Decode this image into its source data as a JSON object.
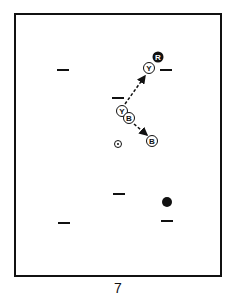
{
  "figure": {
    "caption": "7",
    "court": {
      "x": 15,
      "y": 14,
      "width": 206,
      "height": 262
    },
    "markers": [
      {
        "type": "dash",
        "x": 57,
        "y": 70
      },
      {
        "type": "dash",
        "x": 160,
        "y": 70
      },
      {
        "type": "dash",
        "x": 112,
        "y": 98
      },
      {
        "type": "dash",
        "x": 113,
        "y": 194
      },
      {
        "type": "dash",
        "x": 161,
        "y": 221
      },
      {
        "type": "dash",
        "x": 58,
        "y": 223
      }
    ],
    "players": [
      {
        "label": "R",
        "style": "filled",
        "x": 158,
        "y": 57
      },
      {
        "label": "Y",
        "style": "outline",
        "x": 149,
        "y": 68
      },
      {
        "label": "Y",
        "style": "outline",
        "x": 122,
        "y": 111
      },
      {
        "label": "B",
        "style": "outline",
        "x": 129,
        "y": 118
      },
      {
        "label": "B",
        "style": "outline",
        "x": 152,
        "y": 141
      }
    ],
    "target": {
      "type": "dot-in-circle",
      "x": 118,
      "y": 144
    },
    "ball": {
      "type": "filled-dot",
      "x": 167,
      "y": 202
    },
    "arrows": [
      {
        "from": "Y-lower",
        "to": "Y-top",
        "style": "dashed"
      },
      {
        "from": "B-lower",
        "to": "B-right",
        "style": "dashed"
      }
    ]
  }
}
